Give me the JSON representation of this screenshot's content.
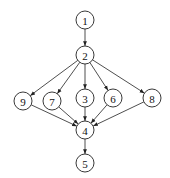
{
  "diagram": {
    "type": "directed-graph",
    "node_radius": 9,
    "colors": {
      "stroke": "#222222",
      "fill": "#ffffff",
      "text": "#111111"
    },
    "nodes": [
      {
        "id": "1",
        "label": "1",
        "x": 85,
        "y": 20
      },
      {
        "id": "2",
        "label": "2",
        "x": 85,
        "y": 55
      },
      {
        "id": "9",
        "label": "9",
        "x": 23,
        "y": 101
      },
      {
        "id": "7",
        "label": "7",
        "x": 52,
        "y": 101
      },
      {
        "id": "3",
        "label": "3",
        "x": 85,
        "y": 98
      },
      {
        "id": "6",
        "label": "6",
        "x": 113,
        "y": 98
      },
      {
        "id": "8",
        "label": "8",
        "x": 152,
        "y": 98
      },
      {
        "id": "4",
        "label": "4",
        "x": 85,
        "y": 130
      },
      {
        "id": "5",
        "label": "5",
        "x": 85,
        "y": 163
      }
    ],
    "edges": [
      {
        "from": "1",
        "to": "2"
      },
      {
        "from": "2",
        "to": "9"
      },
      {
        "from": "2",
        "to": "7"
      },
      {
        "from": "2",
        "to": "3"
      },
      {
        "from": "2",
        "to": "6"
      },
      {
        "from": "2",
        "to": "8"
      },
      {
        "from": "9",
        "to": "4"
      },
      {
        "from": "7",
        "to": "4"
      },
      {
        "from": "3",
        "to": "4"
      },
      {
        "from": "6",
        "to": "4"
      },
      {
        "from": "8",
        "to": "4"
      },
      {
        "from": "4",
        "to": "5"
      }
    ]
  }
}
